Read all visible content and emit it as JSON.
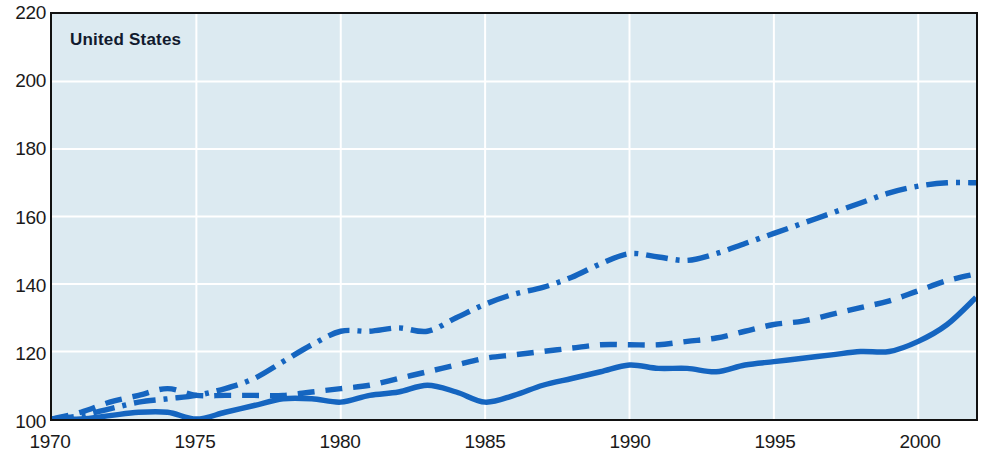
{
  "chart_data": {
    "type": "line",
    "title": "United States",
    "xlabel": "",
    "ylabel": "",
    "xlim": [
      1970,
      2002
    ],
    "ylim": [
      100,
      220
    ],
    "ytick_labels": [
      "220",
      "200",
      "180",
      "160",
      "140",
      "120",
      "100"
    ],
    "yticks": [
      220,
      200,
      180,
      160,
      140,
      120,
      100
    ],
    "xtick_labels": [
      "1970",
      "1975",
      "1980",
      "1985",
      "1990",
      "1995",
      "2000"
    ],
    "xticks": [
      1970,
      1975,
      1980,
      1985,
      1990,
      1995,
      2000
    ],
    "grid": true,
    "grid_color": "#ffffff",
    "background_color": "#dceaf1",
    "line_color": "#1565c0",
    "legend": "none",
    "x": [
      1970,
      1971,
      1972,
      1973,
      1974,
      1975,
      1976,
      1977,
      1978,
      1979,
      1980,
      1981,
      1982,
      1983,
      1984,
      1985,
      1986,
      1987,
      1988,
      1989,
      1990,
      1991,
      1992,
      1993,
      1994,
      1995,
      1996,
      1997,
      1998,
      1999,
      2000,
      2001,
      2002
    ],
    "series": [
      {
        "name": "series-dashdot",
        "style": "dash-dot",
        "values": [
          100,
          101,
          103,
          105,
          106,
          107,
          109,
          112,
          117,
          122,
          126,
          126,
          127,
          126,
          130,
          134,
          137,
          139,
          142,
          146,
          149,
          148,
          147,
          149,
          152,
          155,
          158,
          161,
          164,
          167,
          169,
          170,
          170
        ]
      },
      {
        "name": "series-dashed",
        "style": "dashed",
        "values": [
          100,
          102,
          105,
          107,
          109,
          107,
          107,
          107,
          107,
          108,
          109,
          110,
          112,
          114,
          116,
          118,
          119,
          120,
          121,
          122,
          122,
          122,
          123,
          124,
          126,
          128,
          129,
          131,
          133,
          135,
          138,
          141,
          143
        ]
      },
      {
        "name": "series-solid",
        "style": "solid",
        "values": [
          100,
          100,
          101,
          102,
          102,
          100,
          102,
          104,
          106,
          106,
          105,
          107,
          108,
          110,
          108,
          105,
          107,
          110,
          112,
          114,
          116,
          115,
          115,
          114,
          116,
          117,
          118,
          119,
          120,
          120,
          123,
          128,
          136
        ]
      }
    ]
  }
}
